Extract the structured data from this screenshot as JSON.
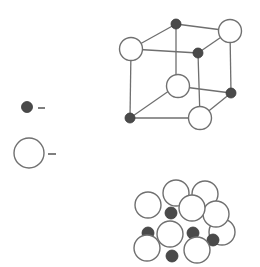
{
  "diagram": {
    "type": "crystal-lattice-unit-cell",
    "colors": {
      "large_ion_fill": "#ffffff",
      "large_ion_stroke": "#707070",
      "small_ion_fill": "#4a4a4a",
      "bond": "#6f6f6f"
    },
    "legend": [
      {
        "symbol": "small-dark-sphere",
        "label": "-"
      },
      {
        "symbol": "large-open-sphere",
        "label": "-"
      }
    ],
    "ball_and_stick": {
      "large_ions": [
        {
          "x": 131,
          "y": 49,
          "r": 11.5
        },
        {
          "x": 230,
          "y": 31,
          "r": 11.5
        },
        {
          "x": 178,
          "y": 86,
          "r": 11.5
        },
        {
          "x": 200,
          "y": 118,
          "r": 11.5
        }
      ],
      "small_ions": [
        {
          "x": 176,
          "y": 24,
          "r": 5
        },
        {
          "x": 198,
          "y": 53,
          "r": 5
        },
        {
          "x": 231,
          "y": 93,
          "r": 5
        },
        {
          "x": 130,
          "y": 118,
          "r": 5
        }
      ]
    },
    "space_filling": {
      "large_ions": [
        {
          "x": 205,
          "y": 194,
          "r": 13
        },
        {
          "x": 176,
          "y": 193,
          "r": 13
        },
        {
          "x": 222,
          "y": 232,
          "r": 13
        },
        {
          "x": 216,
          "y": 214,
          "r": 13
        },
        {
          "x": 148,
          "y": 205,
          "r": 13
        },
        {
          "x": 192,
          "y": 208,
          "r": 13
        },
        {
          "x": 170,
          "y": 234,
          "r": 13
        },
        {
          "x": 147,
          "y": 248,
          "r": 13
        },
        {
          "x": 197,
          "y": 250,
          "r": 13
        }
      ],
      "small_ions": [
        {
          "x": 171,
          "y": 213,
          "r": 6
        },
        {
          "x": 148,
          "y": 233,
          "r": 6
        },
        {
          "x": 193,
          "y": 233,
          "r": 6
        },
        {
          "x": 172,
          "y": 256,
          "r": 6
        },
        {
          "x": 213,
          "y": 240,
          "r": 6
        }
      ]
    }
  }
}
